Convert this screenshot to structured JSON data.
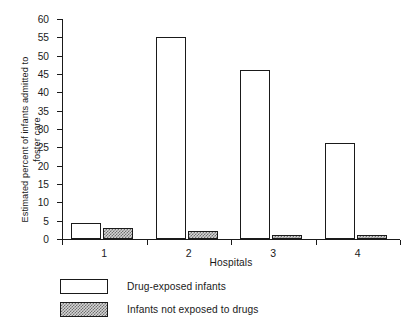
{
  "chart_data": {
    "type": "bar",
    "title": "",
    "xlabel": "Hospitals",
    "ylabel": "Estimated percent of infants admitted to\nfoster care",
    "categories": [
      "1",
      "2",
      "3",
      "4"
    ],
    "series": [
      {
        "name": "Drug-exposed infants",
        "values": [
          4.3,
          55.2,
          46.2,
          26.1
        ],
        "style": "open"
      },
      {
        "name": "Infants not exposed to drugs",
        "values": [
          3.0,
          2.1,
          1.2,
          1.2
        ],
        "style": "hatched"
      }
    ],
    "ylim": [
      0,
      60
    ],
    "yticks": [
      0,
      5,
      10,
      15,
      20,
      25,
      30,
      35,
      40,
      45,
      50,
      55,
      60
    ],
    "ytick_labels": [
      "0",
      "5",
      "10",
      "15",
      "20",
      "25",
      "30",
      "35",
      "40",
      "45",
      "50",
      "55",
      "60"
    ],
    "xtick_labels": [
      "1",
      "2",
      "3",
      "4"
    ],
    "grid": false,
    "legend_position": "below-left",
    "colors": {
      "axis": "#1a1a1a",
      "bar_open_fill": "#ffffff",
      "bar_open_edge": "#1a1a1a",
      "bar_hatch_fill": "#d4d4d4",
      "bar_hatch_pattern": "#707070",
      "background": "#ffffff"
    }
  },
  "legend": {
    "items": [
      {
        "label": "Drug-exposed infants",
        "style": "open"
      },
      {
        "label": "Infants not exposed to drugs",
        "style": "hatched"
      }
    ]
  }
}
